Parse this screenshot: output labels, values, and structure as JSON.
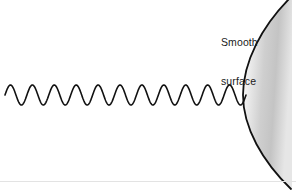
{
  "figure": {
    "width": 296,
    "height": 192,
    "background_color": "#ffffff"
  },
  "labels": {
    "surface": {
      "line1": "Smooth",
      "line2": "surface",
      "color": "#1a1a1a",
      "x": 221,
      "y": 10
    }
  },
  "wave": {
    "name": "incident-wave",
    "stroke_color": "#111111",
    "stroke_width": 1.6,
    "x_start": 5,
    "x_end": 246,
    "center_y": 95,
    "amplitude": 10,
    "cycles": 11,
    "wavelength": 21.9
  },
  "surface_shape": {
    "name": "smooth-curved-surface",
    "type": "convex-arc",
    "stroke_color": "#111111",
    "stroke_width": 1.8,
    "fill_gradient": {
      "from": "#ffffff",
      "mid": "#c9c9c9",
      "to": "#e8e8e8"
    },
    "arc_top_x": 290,
    "arc_top_y": 0,
    "arc_apex_x": 243,
    "arc_apex_y": 95,
    "arc_bottom_x": 291,
    "arc_bottom_y": 187,
    "right_edge_x": 292
  },
  "divider": {
    "name": "bottom-divider",
    "color": "#e3e3e3",
    "y": 181
  },
  "chart_data": {
    "type": "line",
    "xlabel": "",
    "ylabel": "",
    "series": [
      {
        "name": "incident-wave",
        "description": "sinusoidal wave travelling left to right",
        "cycles": 11,
        "amplitude": 10,
        "baseline_y": 95,
        "x_range": [
          5,
          246
        ]
      }
    ],
    "annotations": [
      "Smooth surface"
    ],
    "grid": false,
    "legend": "none"
  }
}
